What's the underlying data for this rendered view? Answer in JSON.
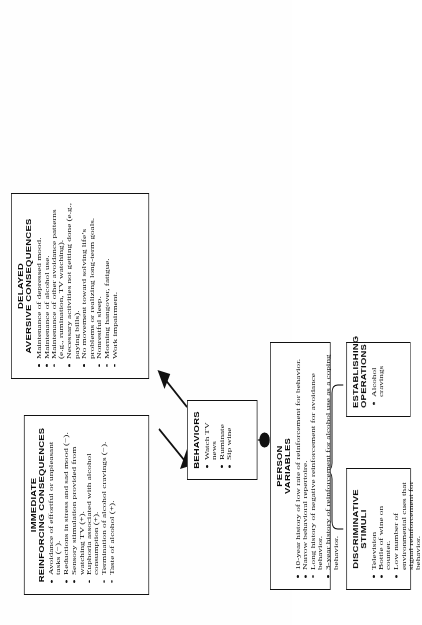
{
  "diagram": {
    "type": "functional-analysis-flow",
    "orientation": "rotated-90-ccw",
    "accent_color": "#111111",
    "background_color": "#ffffff",
    "nodes": [
      {
        "id": "discriminative-stimuli",
        "title_line1": "DISCRIMINATIVE",
        "title_line2": "STIMULI",
        "items": [
          "Television",
          "Bottle of wine on counter.",
          "Low number of environmental cues that signal reinforcement for behavior."
        ]
      },
      {
        "id": "establishing-operations",
        "title_line1": "ESTABLISHING",
        "title_line2": "OPERATIONS",
        "items": [
          "Alcohol cravings"
        ]
      },
      {
        "id": "person-variables",
        "title_line1": "PERSON",
        "title_line2": "VARIABLES",
        "items": [
          "10-year history of low rate of reinforcement for behavior.",
          "Narrow behavioral repertoire.",
          "Long history of negative reinforcement for avoidance behavior.",
          "3-year history of reinforcement for alcohol use as a coping behavior."
        ]
      },
      {
        "id": "behaviors",
        "title_line1": "BEHAVIORS",
        "title_line2": "",
        "items": [
          "Watch TV news",
          "Ruminate",
          "Sip wine"
        ]
      },
      {
        "id": "immediate-reinforcing-consequences",
        "title_line1": "IMMEDIATE",
        "title_line2": "REINFORCING CONSEQUENCES",
        "items": [
          "Avoidance of effortful or unpleasant tasks (−).",
          "Reductions in stress and sad mood (−).",
          "Sensory stimulation provided from watching TV (+).",
          "Euphoria associated with alcohol consumption (+).",
          "Termination of alcohol cravings (−).",
          "Taste of alcohol (+)."
        ]
      },
      {
        "id": "delayed-aversive-consequences",
        "title_line1": "DELAYED",
        "title_line2": "AVERSIVE CONSEQUENCES",
        "items": [
          "Maintenance of depressed mood.",
          "Maintenance of alcohol use.",
          "Maintenance of other avoidance patterns (e.g., rumination, TV watching).",
          "Necessary activities not getting done (e.g., paying bills).",
          "No movement toward solving life’s problems or realizing long-term goals.",
          "Nonrestful sleep.",
          "Morning hangover, fatigue.",
          "Work impairment."
        ]
      }
    ],
    "connectors": [
      {
        "from": "discriminative-stimuli+establishing-operations",
        "to": "person-variables",
        "style": "brace-to-dot"
      },
      {
        "from": "person-variables",
        "to": "behaviors",
        "style": "dot-line"
      },
      {
        "from": "behaviors",
        "to": "immediate-reinforcing-consequences",
        "style": "arrow"
      },
      {
        "from": "behaviors",
        "to": "delayed-aversive-consequences",
        "style": "arrow"
      }
    ]
  }
}
